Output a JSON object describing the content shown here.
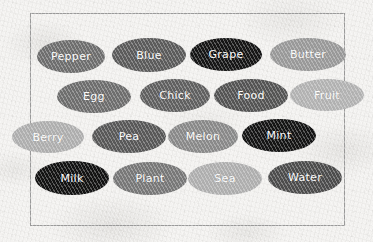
{
  "canvas": {
    "width": 373,
    "height": 242,
    "background_color": "#f3f2f0",
    "texture": "mottled-paper"
  },
  "frame": {
    "name": "border-rectangle",
    "x": 30,
    "y": 13,
    "width": 315,
    "height": 213,
    "stroke_color": "#9b9b9b",
    "stroke_width": 1.2
  },
  "label_style": {
    "text_color": "#ffffff",
    "font_size": 11
  },
  "bubbles": [
    {
      "label": "Pepper",
      "color": "#6e6e6e",
      "x": 37,
      "y": 40,
      "width": 68,
      "height": 33,
      "row": 1,
      "col": 1
    },
    {
      "label": "Blue",
      "color": "#5b5b5b",
      "x": 112,
      "y": 38,
      "width": 74,
      "height": 34,
      "row": 1,
      "col": 2
    },
    {
      "label": "Grape",
      "color": "#151515",
      "x": 190,
      "y": 38,
      "width": 72,
      "height": 33,
      "row": 1,
      "col": 3
    },
    {
      "label": "Butter",
      "color": "#9a9a9a",
      "x": 270,
      "y": 38,
      "width": 76,
      "height": 33,
      "row": 1,
      "col": 4
    },
    {
      "label": "Egg",
      "color": "#6e6e6e",
      "x": 57,
      "y": 80,
      "width": 74,
      "height": 33,
      "row": 2,
      "col": 1
    },
    {
      "label": "Chick",
      "color": "#606060",
      "x": 140,
      "y": 79,
      "width": 70,
      "height": 33,
      "row": 2,
      "col": 2
    },
    {
      "label": "Food",
      "color": "#545454",
      "x": 214,
      "y": 79,
      "width": 74,
      "height": 33,
      "row": 2,
      "col": 3
    },
    {
      "label": "Fruit",
      "color": "#b4b4b4",
      "x": 290,
      "y": 79,
      "width": 74,
      "height": 32,
      "row": 2,
      "col": 4
    },
    {
      "label": "Berry",
      "color": "#b0b0b0",
      "x": 12,
      "y": 121,
      "width": 72,
      "height": 32,
      "row": 3,
      "col": 1
    },
    {
      "label": "Pea",
      "color": "#585858",
      "x": 92,
      "y": 120,
      "width": 74,
      "height": 33,
      "row": 3,
      "col": 2
    },
    {
      "label": "Melon",
      "color": "#8a8a8a",
      "x": 168,
      "y": 120,
      "width": 70,
      "height": 33,
      "row": 3,
      "col": 3
    },
    {
      "label": "Mint",
      "color": "#141414",
      "x": 242,
      "y": 119,
      "width": 74,
      "height": 33,
      "row": 3,
      "col": 4
    },
    {
      "label": "Milk",
      "color": "#121212",
      "x": 35,
      "y": 161,
      "width": 74,
      "height": 34,
      "row": 4,
      "col": 1
    },
    {
      "label": "Plant",
      "color": "#787878",
      "x": 113,
      "y": 162,
      "width": 74,
      "height": 33,
      "row": 4,
      "col": 2
    },
    {
      "label": "Sea",
      "color": "#b0b0b0",
      "x": 188,
      "y": 162,
      "width": 74,
      "height": 33,
      "row": 4,
      "col": 3
    },
    {
      "label": "Water",
      "color": "#4c4c4c",
      "x": 268,
      "y": 161,
      "width": 74,
      "height": 33,
      "row": 4,
      "col": 4
    }
  ]
}
